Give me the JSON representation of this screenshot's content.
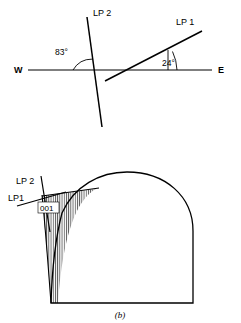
{
  "figure": {
    "caption": "(b)",
    "panels": [
      {
        "id": "top-panel",
        "name": "orientation-diagram",
        "compass": {
          "west_label": "W",
          "east_label": "E"
        },
        "lines": [
          {
            "name": "LP 2",
            "label": "LP 2"
          },
          {
            "name": "LP 1",
            "label": "LP 1"
          }
        ],
        "angles": [
          {
            "name": "angle-lp2",
            "label": "83°",
            "value": 83,
            "unit": "degrees"
          },
          {
            "name": "angle-lp1",
            "label": "24°",
            "value": 24,
            "unit": "degrees"
          }
        ]
      },
      {
        "id": "bottom-panel",
        "name": "crystal-section-diagram",
        "lines": [
          {
            "name": "LP 2",
            "label": "LP 2"
          },
          {
            "name": "LP 1",
            "label": "LP1"
          }
        ],
        "index_label": "001"
      }
    ]
  },
  "style": {
    "ink": "#000000",
    "background": "#ffffff"
  }
}
